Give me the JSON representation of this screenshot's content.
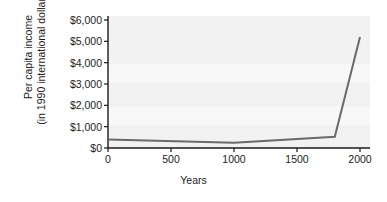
{
  "chart_data": {
    "type": "line",
    "title": "",
    "xlabel": "Years",
    "ylabel": "Per capita income (in 1990 international dollars)",
    "ylabel_line1": "Per capita income",
    "ylabel_line2": "(in 1990 international dollars)",
    "xlim": [
      0,
      2000
    ],
    "ylim": [
      0,
      6000
    ],
    "grid": false,
    "legend": "none",
    "x_ticks": [
      0,
      500,
      1000,
      1500,
      2000
    ],
    "x_tick_labels": [
      "0",
      "500",
      "1000",
      "1500",
      "2000"
    ],
    "y_ticks": [
      0,
      1000,
      2000,
      3000,
      4000,
      5000,
      6000
    ],
    "y_tick_labels": [
      "$0",
      "$1,000",
      "$2,000",
      "$3,000",
      "$4,000",
      "$5,000",
      "$6,000"
    ],
    "series": [
      {
        "name": "Per capita income",
        "x": [
          0,
          1000,
          1800,
          2000
        ],
        "values": [
          400,
          250,
          530,
          5200
        ]
      }
    ],
    "line_color": "#6a6a6a",
    "plot_background": "#f2f2f2",
    "axis_color": "#1a1a1a"
  }
}
